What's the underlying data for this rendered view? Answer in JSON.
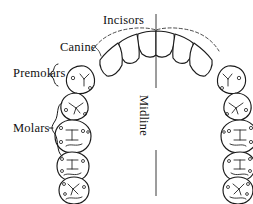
{
  "figure": {
    "background_color": "#ffffff",
    "ink_color": "#1a1a1a",
    "width": 253,
    "height": 204
  },
  "labels": {
    "incisors": "Incisors",
    "canine": "Canine",
    "premolars": "Premolars",
    "molars": "Molars",
    "midline": "Midline"
  },
  "annotations": {
    "midline_orientation": "vertical-rotated-90",
    "premolars_brace_span_teeth": 2,
    "molars_brace_span_teeth": 3,
    "dashed_arc": "incisal-edge-outline"
  },
  "arch": {
    "tooth_groups": [
      {
        "name": "incisors",
        "count": 4,
        "shape": "pointed-arch-crown",
        "side": "both"
      },
      {
        "name": "canine",
        "count": 2,
        "shape": "angular-quadrilateral",
        "side": "both"
      },
      {
        "name": "premolars",
        "count": 4,
        "shape": "rounded-oval-two-cusp",
        "side": "both"
      },
      {
        "name": "molars",
        "count": 6,
        "shape": "rounded-square-multi-cusp",
        "side": "both"
      }
    ]
  }
}
